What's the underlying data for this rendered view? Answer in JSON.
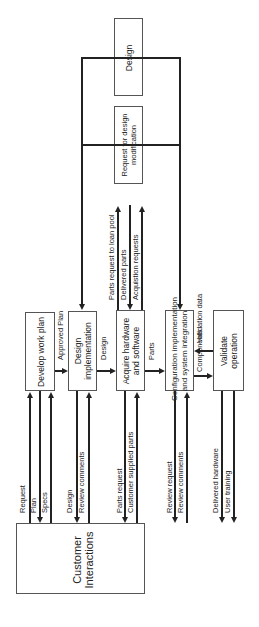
{
  "diagram": {
    "orientation": "rotated -90deg",
    "boxes": {
      "customer": "Customer Interactions",
      "customer_line1": "Customer",
      "customer_line2": "Interactions",
      "develop": "Develop work plan",
      "design_impl_line1": "Design",
      "design_impl_line2": "implementation",
      "acquire_line1": "Acquire hardware",
      "acquire_line2": "and software",
      "config_line1": "Configuration implementation",
      "config_line2": "and system integration",
      "validate_line1": "Validate",
      "validate_line2": "operation",
      "request_mod_line1": "Request for design",
      "request_mod_line2": "modification",
      "design": "Design"
    },
    "flows": {
      "request": "Request",
      "plan": "Plan",
      "specs": "Specs",
      "design_to_impl": "Design",
      "review_comments_1": "Review comments",
      "parts_request": "Parts request",
      "customer_supplied_parts": "Customer supplied parts",
      "review_request": "Review request",
      "review_comments_2": "Review comments",
      "delivered_hardware": "Delivered hardware",
      "user_training": "User training",
      "approved_plan": "Approved Plan",
      "design_out": "Design",
      "parts": "Parts",
      "components": "Components",
      "validation_data": "Validation data",
      "parts_request_loan_pool": "Parts request to loan pool",
      "delivered_parts": "Delivered parts",
      "acquisition_requests": "Acquistion requests"
    }
  }
}
